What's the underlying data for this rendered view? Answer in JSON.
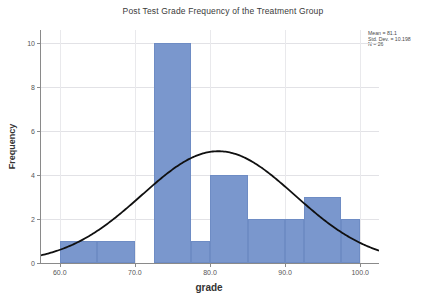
{
  "chart_data": {
    "type": "bar",
    "title": "Post Test Grade Frequency of the Treatment Group",
    "xlabel": "grade",
    "ylabel": "Frequency",
    "xlim": [
      57.5,
      102.5
    ],
    "ylim": [
      0,
      10.6
    ],
    "grid": true,
    "legend": null,
    "xticks": [
      "60.0",
      "70.0",
      "80.0",
      "90.0",
      "100.0"
    ],
    "xtick_values": [
      60,
      70,
      80,
      90,
      100
    ],
    "yticks": [
      "0",
      "2",
      "4",
      "6",
      "8",
      "10"
    ],
    "ytick_values": [
      0,
      2,
      4,
      6,
      8,
      10
    ],
    "bar_color": "#7a97cd",
    "curve_color": "#101010",
    "bins": [
      {
        "label": "60-65",
        "start": 60.0,
        "end": 65.0,
        "value": 1
      },
      {
        "label": "65-70",
        "start": 65.0,
        "end": 70.0,
        "value": 1
      },
      {
        "label": "72.5-77.5",
        "start": 72.5,
        "end": 77.5,
        "value": 10
      },
      {
        "label": "77.5-80",
        "start": 77.5,
        "end": 80.0,
        "value": 1
      },
      {
        "label": "80-85",
        "start": 80.0,
        "end": 85.0,
        "value": 4
      },
      {
        "label": "85-90",
        "start": 85.0,
        "end": 90.0,
        "value": 2
      },
      {
        "label": "90-92.5",
        "start": 90.0,
        "end": 92.5,
        "value": 2
      },
      {
        "label": "92.5-97.5",
        "start": 92.5,
        "end": 97.5,
        "value": 3
      },
      {
        "label": "97.5-100",
        "start": 97.5,
        "end": 100.0,
        "value": 2
      }
    ],
    "normal_curve": {
      "mean": 81.1,
      "std_dev": 10.198,
      "n": 26,
      "bin_width": 5,
      "peak_value": 3.6
    }
  },
  "stats": {
    "mean": "Mean = 81.1",
    "std_dev": "Std. Dev. = 10.198",
    "n": "N = 26"
  }
}
